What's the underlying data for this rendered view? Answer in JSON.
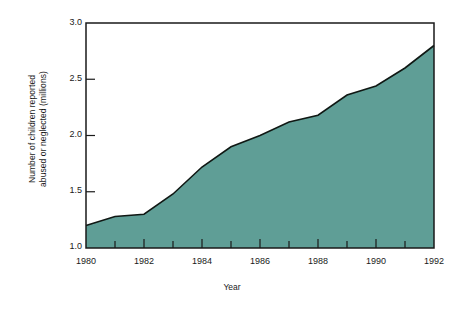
{
  "chart_data": {
    "type": "area",
    "title": "",
    "xlabel": "Year",
    "ylabel": "Number of children reported abused or neglected (millions)",
    "ylabel_lines": [
      "Number of children reported",
      "abused or neglected (millions)"
    ],
    "x": [
      1980,
      1981,
      1982,
      1983,
      1984,
      1985,
      1986,
      1987,
      1988,
      1989,
      1990,
      1991,
      1992
    ],
    "values": [
      1.2,
      1.28,
      1.3,
      1.48,
      1.72,
      1.9,
      2.0,
      2.12,
      2.18,
      2.36,
      2.44,
      2.6,
      2.8
    ],
    "series": [
      {
        "name": "Children reported abused or neglected",
        "values": [
          1.2,
          1.28,
          1.3,
          1.48,
          1.72,
          1.9,
          2.0,
          2.12,
          2.18,
          2.36,
          2.44,
          2.6,
          2.8
        ]
      }
    ],
    "xlim": [
      1980,
      1992
    ],
    "ylim": [
      1.0,
      3.0
    ],
    "ytick_labels": [
      "1.0",
      "1.5",
      "2.0",
      "2.5",
      "3.0"
    ],
    "ytick_values": [
      1.0,
      1.5,
      2.0,
      2.5,
      3.0
    ],
    "xtick_labels": [
      "1980",
      "1982",
      "1984",
      "1986",
      "1988",
      "1990",
      "1992"
    ],
    "xtick_values": [
      1980,
      1982,
      1984,
      1986,
      1988,
      1990,
      1992
    ],
    "xminor_values": [
      1981,
      1983,
      1985,
      1987,
      1989,
      1991
    ],
    "grid": false,
    "legend": "none",
    "colors": {
      "area_fill": "#5f9e96",
      "line": "#101814",
      "axis": "#1a1a1a",
      "background": "#ffffff",
      "text": "#1a1a1a"
    }
  }
}
